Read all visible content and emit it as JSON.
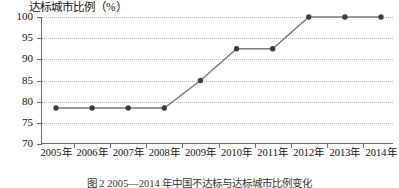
{
  "chart_data": {
    "type": "line",
    "title": "",
    "ylabel": "达标城市比例（%）",
    "xlabel": "",
    "categories": [
      "2005年",
      "2006年",
      "2007年",
      "2008年",
      "2009年",
      "2010年",
      "2011年",
      "2012年",
      "2013年",
      "2014年"
    ],
    "values": [
      78.5,
      78.5,
      78.5,
      78.5,
      85.0,
      92.5,
      92.5,
      100.0,
      100.0,
      100.0
    ],
    "ylim": [
      70,
      100
    ],
    "yticks": [
      70,
      75,
      80,
      85,
      90,
      95,
      100
    ],
    "ytick_labels": [
      "70",
      "75",
      "80",
      "85",
      "90",
      "95",
      "100"
    ],
    "grid": true,
    "grid_style": "dotted",
    "legend": "none",
    "marker": "filled-circle",
    "line_color": "#7a7a7a",
    "marker_color": "#3b3b3b",
    "grid_color": "#bcbcbc",
    "axis_color": "#6b6b6b"
  },
  "caption": {
    "text": "图 2  2005—2014 年中国不达标与达标城市比例变化"
  }
}
